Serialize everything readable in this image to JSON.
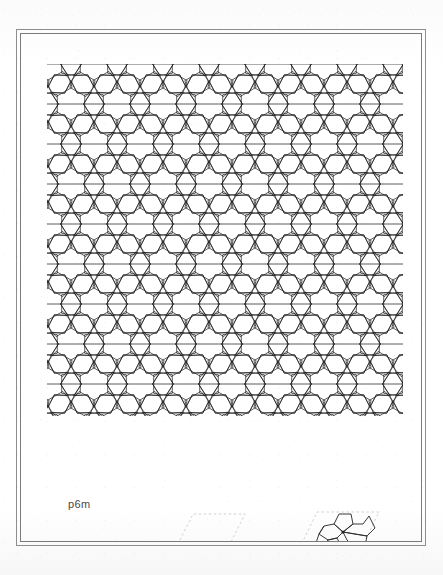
{
  "page": {
    "background_color": "#ffffff",
    "width": 443,
    "height": 575
  },
  "frame": {
    "outer_border_color": "#8d8d8d",
    "inner_border_color": "#7a7a7a",
    "style": "double-rule-rectangle"
  },
  "plate": {
    "title_label": "p6m",
    "label_color": "#4a4a4a",
    "description": "Periodic Islamic geometric tiling composed of six-pointed stars, irregular pentagons and hexagons, drawn in thin black line work on white ground.",
    "line_color": "#1a1a1a",
    "line_width": 0.7
  },
  "pattern": {
    "symmetry_group": "p6m",
    "motif_names": [
      "six-pointed-star",
      "pentagon",
      "hexagon",
      "rhombus"
    ],
    "lattice": "hexagonal",
    "cell_width_px": 46,
    "cell_height_px": 40,
    "columns": 9,
    "rows": 10,
    "extent": {
      "left": 27,
      "top": 30,
      "right": 380,
      "bottom": 380
    }
  },
  "diagrams": [
    {
      "name": "unit-cell-diagram",
      "caption": "",
      "style": "dashed rhombus outline with faint motif fragment",
      "dash_color": "#b8b8b8",
      "motif_color": "#333333",
      "angle_degrees": 60
    },
    {
      "name": "motif-diagram",
      "caption": "",
      "style": "dashed rhombus outline containing pentagon rosette fragment",
      "dash_color": "#b8b8b8",
      "motif_color": "#333333",
      "angle_degrees": 60
    }
  ],
  "chart_data": {
    "type": "diagram",
    "title": "p6m",
    "xlabel": "",
    "ylabel": "",
    "categories": [
      "six-pointed-star",
      "pentagon",
      "hexagon"
    ],
    "values": [
      1,
      6,
      1
    ]
  }
}
